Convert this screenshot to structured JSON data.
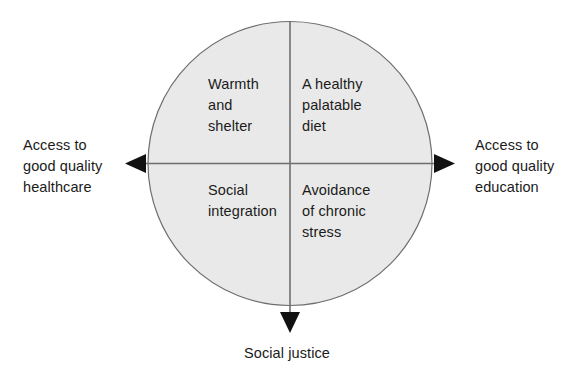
{
  "diagram": {
    "colors": {
      "circle_fill": "#e9e9e9",
      "circle_stroke": "#6e6e6e",
      "axis_line": "#6e6e6e",
      "arrow_fill": "#111111",
      "text": "#1b1b1b",
      "background": "#ffffff"
    },
    "circle": {
      "center_x": 290,
      "center_y": 163,
      "radius": 142
    },
    "quadrants": {
      "top_left": "Warmth\nand\nshelter",
      "top_right": "A healthy\npalatable\ndiet",
      "bottom_left": "Social\nintegration",
      "bottom_right": "Avoidance\nof chronic\nstress"
    },
    "axis_labels": {
      "left": "Access to\ngood quality\nhealthcare",
      "right": "Access to\ngood quality\neducation",
      "bottom": "Social justice"
    },
    "arrows": {
      "left": "arrow-left-icon",
      "right": "arrow-right-icon",
      "down": "arrow-down-icon"
    }
  }
}
